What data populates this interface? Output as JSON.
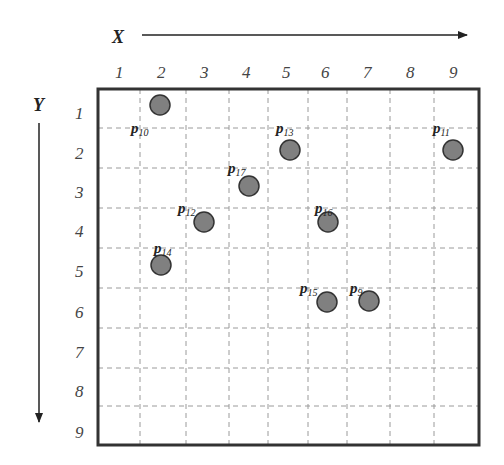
{
  "axes": {
    "x": {
      "title": "X",
      "ticks": [
        "1",
        "2",
        "3",
        "4",
        "5",
        "6",
        "7",
        "8",
        "9"
      ]
    },
    "y": {
      "title": "Y",
      "ticks": [
        "1",
        "2",
        "3",
        "4",
        "5",
        "6",
        "7",
        "8",
        "9"
      ]
    }
  },
  "points": [
    {
      "name": "p",
      "sub": "10",
      "cx": 160,
      "cy": 105,
      "lx": 131,
      "ly": 133
    },
    {
      "name": "p",
      "sub": "13",
      "cx": 290,
      "cy": 150,
      "lx": 276,
      "ly": 133
    },
    {
      "name": "p",
      "sub": "11",
      "cx": 453,
      "cy": 150,
      "lx": 433,
      "ly": 133
    },
    {
      "name": "p",
      "sub": "17",
      "cx": 249,
      "cy": 186,
      "lx": 228,
      "ly": 173
    },
    {
      "name": "p",
      "sub": "12",
      "cx": 204,
      "cy": 222,
      "lx": 178,
      "ly": 213
    },
    {
      "name": "p",
      "sub": "16",
      "cx": 328,
      "cy": 222,
      "lx": 315,
      "ly": 213
    },
    {
      "name": "p",
      "sub": "14",
      "cx": 161,
      "cy": 265,
      "lx": 154,
      "ly": 253
    },
    {
      "name": "p",
      "sub": "15",
      "cx": 327,
      "cy": 302,
      "lx": 300,
      "ly": 293
    },
    {
      "name": "p",
      "sub": "9",
      "cx": 369,
      "cy": 301,
      "lx": 350,
      "ly": 293
    }
  ],
  "colors": {
    "point_fill": "#808080",
    "frame": "#333333",
    "grid": "#9a9a9a"
  }
}
